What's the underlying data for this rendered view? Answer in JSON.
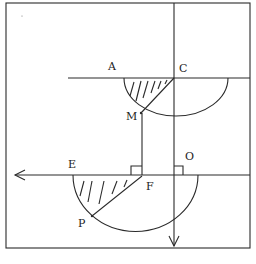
{
  "diagram": {
    "labels": {
      "A": "A",
      "C": "C",
      "M": "M",
      "E": "E",
      "F": "F",
      "O": "O",
      "P": "P"
    },
    "colors": {
      "line": "#2a2a2a",
      "background": "#ffffff"
    }
  }
}
